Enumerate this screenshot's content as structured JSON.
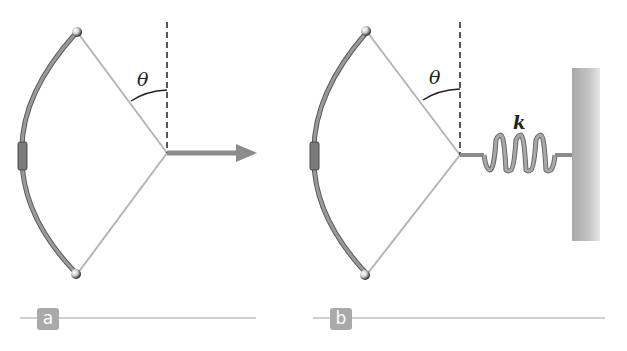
{
  "figure": {
    "panels": [
      {
        "id": "a",
        "tag_label": "a",
        "angle_label": "θ",
        "elements": [
          "bow",
          "string",
          "vertical-dashed-reference",
          "pull-force-arrow"
        ]
      },
      {
        "id": "b",
        "tag_label": "b",
        "angle_label": "θ",
        "spring_label": "k",
        "elements": [
          "bow",
          "string",
          "vertical-dashed-reference",
          "spring",
          "wall"
        ]
      }
    ],
    "colors": {
      "bow": "#8a8a8a",
      "bow_edge": "#5a5a5a",
      "string": "#b5b5b5",
      "arrow": "#8c8c8c",
      "spring": "#9a9a9a",
      "wall": "#b8b8b8",
      "tag_bg": "#a9a9a9",
      "rule": "#cfcfcf",
      "dashed": "#222222"
    }
  }
}
